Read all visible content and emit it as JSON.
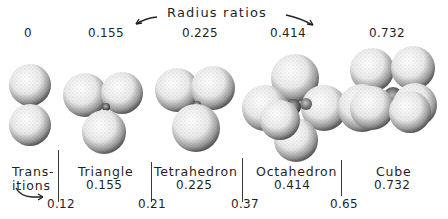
{
  "title": "Radius ratios",
  "top_ratios": [
    "0",
    "0.155",
    "0.225",
    "0.414",
    "0.732"
  ],
  "geometries": [
    {
      "name_line1": "Trans-",
      "name_line2": "itions",
      "spheres": 2
    },
    {
      "name": "Triangle",
      "ratio": "0.155",
      "spheres": 3
    },
    {
      "name": "Tetrahedron",
      "ratio": "0.225",
      "spheres": 4
    },
    {
      "name": "Octahedron",
      "ratio": "0.414",
      "spheres": 6
    },
    {
      "name": "Cube",
      "ratio": "0.732",
      "spheres": 8
    }
  ],
  "transitions": [
    "0.12",
    "0.21",
    "0.37",
    "0.65"
  ],
  "colors": {
    "ink": "#1f1f1f",
    "background": "#ffffff"
  }
}
